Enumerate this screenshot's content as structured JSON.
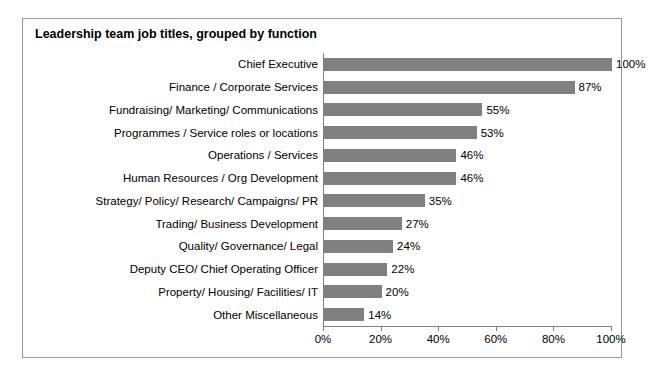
{
  "chart_data": {
    "type": "bar",
    "orientation": "horizontal",
    "title": "Leadership team job titles, grouped by function",
    "xlabel": "",
    "ylabel": "",
    "xlim": [
      0,
      100
    ],
    "xticks": [
      "0%",
      "20%",
      "40%",
      "60%",
      "80%",
      "100%"
    ],
    "xtick_values": [
      0,
      20,
      40,
      60,
      80,
      100
    ],
    "grid": false,
    "legend": null,
    "bar_color": "#808080",
    "categories": [
      "Chief Executive",
      "Finance / Corporate Services",
      "Fundraising/ Marketing/ Communications",
      "Programmes / Service roles or locations",
      "Operations / Services",
      "Human Resources / Org Development",
      "Strategy/ Policy/ Research/ Campaigns/ PR",
      "Trading/ Business Development",
      "Quality/ Governance/ Legal",
      "Deputy CEO/ Chief Operating Officer",
      "Property/ Housing/ Facilities/ IT",
      "Other Miscellaneous"
    ],
    "values": [
      100,
      87,
      55,
      53,
      46,
      46,
      35,
      27,
      24,
      22,
      20,
      14
    ],
    "data_labels": [
      "100%",
      "87%",
      "55%",
      "53%",
      "46%",
      "46%",
      "35%",
      "27%",
      "24%",
      "22%",
      "20%",
      "14%"
    ]
  }
}
